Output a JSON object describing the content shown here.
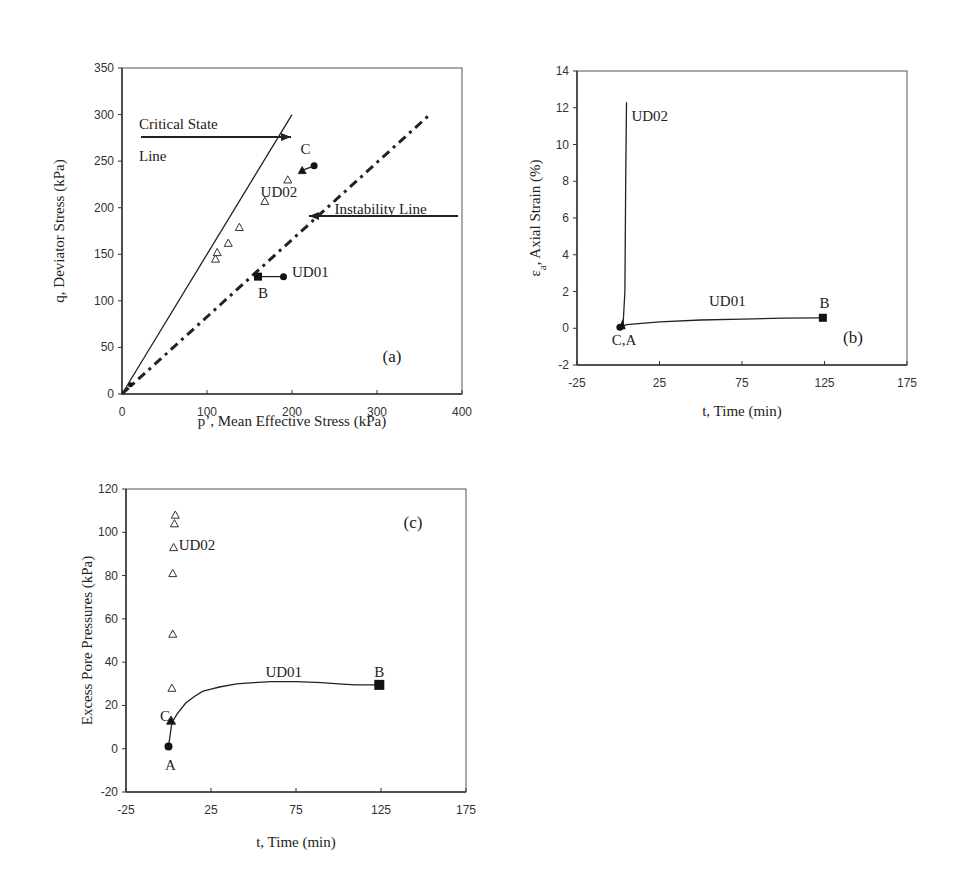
{
  "chart_data": [
    {
      "id": "a",
      "type": "scatter",
      "panel_label": "(a)",
      "title": "",
      "xlabel": "p’, Mean Effective Stress (kPa)",
      "ylabel": "q, Deviator Stress (kPa)",
      "xlim": [
        0,
        400
      ],
      "ylim": [
        0,
        350
      ],
      "xticks": [
        "0",
        "100",
        "200",
        "300",
        "400"
      ],
      "yticks": [
        "0",
        "50",
        "100",
        "150",
        "200",
        "250",
        "300",
        "350"
      ],
      "grid": false,
      "series": [
        {
          "name": "Critical State Line",
          "style": "solid line",
          "x": [
            0,
            200
          ],
          "y": [
            0,
            300
          ]
        },
        {
          "name": "Instability Line",
          "style": "dashed line",
          "x": [
            0,
            362
          ],
          "y": [
            0,
            300
          ]
        },
        {
          "name": "UD01",
          "style": "line with markers",
          "x": [
            190,
            160
          ],
          "y": [
            126,
            126
          ]
        },
        {
          "name": "UD02",
          "style": "open triangles",
          "x": [
            110,
            112,
            125,
            138,
            168,
            195
          ],
          "y": [
            145,
            152,
            162,
            179,
            207,
            230
          ]
        },
        {
          "name": "UD02 start/C",
          "style": "filled markers",
          "x": [
            226,
            212
          ],
          "y": [
            245,
            240
          ]
        }
      ],
      "annotations": [
        {
          "text": "Critical State",
          "x": 20,
          "y": 285
        },
        {
          "text": "Line",
          "x": 20,
          "y": 250
        },
        {
          "text": "Instability Line",
          "x": 250,
          "y": 193
        },
        {
          "text": "C",
          "x": 210,
          "y": 258
        },
        {
          "text": "UD02",
          "x": 163,
          "y": 211
        },
        {
          "text": "UD01",
          "x": 200,
          "y": 126
        },
        {
          "text": "B",
          "x": 160,
          "y": 103
        }
      ]
    },
    {
      "id": "b",
      "type": "line",
      "panel_label": "(b)",
      "title": "",
      "xlabel": "t, Time (min)",
      "ylabel": "εa, Axial Strain (%)",
      "ylabel_main": "ε",
      "ylabel_sub": "a",
      "ylabel_rest": ", Axial Strain (%)",
      "xlim": [
        -25,
        175
      ],
      "ylim": [
        -2,
        14
      ],
      "xticks": [
        "-25",
        "25",
        "75",
        "125",
        "175"
      ],
      "yticks": [
        "-2",
        "0",
        "2",
        "4",
        "6",
        "8",
        "10",
        "12",
        "14"
      ],
      "grid": false,
      "series": [
        {
          "name": "UD02",
          "x": [
            2,
            3,
            4,
            4.5,
            5
          ],
          "y": [
            0.1,
            0.3,
            2,
            8,
            12.3
          ]
        },
        {
          "name": "UD01",
          "x": [
            1,
            5,
            25,
            50,
            75,
            100,
            124
          ],
          "y": [
            0.05,
            0.2,
            0.35,
            0.45,
            0.5,
            0.55,
            0.57
          ]
        }
      ],
      "annotations": [
        {
          "text": "UD02",
          "x": 8,
          "y": 11.3
        },
        {
          "text": "UD01",
          "x": 55,
          "y": 1.2
        },
        {
          "text": "B",
          "x": 122,
          "y": 1.1
        },
        {
          "text": "C,A",
          "x": -4,
          "y": -0.9
        }
      ]
    },
    {
      "id": "c",
      "type": "scatter",
      "panel_label": "(c)",
      "title": "",
      "xlabel": "t, Time (min)",
      "ylabel": "Excess Pore Pressures (kPa)",
      "xlim": [
        -25,
        175
      ],
      "ylim": [
        -20,
        120
      ],
      "xticks": [
        "-25",
        "25",
        "75",
        "125",
        "175"
      ],
      "yticks": [
        "-20",
        "0",
        "20",
        "40",
        "60",
        "80",
        "100",
        "120"
      ],
      "grid": false,
      "series": [
        {
          "name": "UD02",
          "style": "open triangles",
          "x": [
            2,
            2.5,
            2.5,
            3,
            3.5,
            4
          ],
          "y": [
            28,
            53,
            81,
            93,
            104,
            108
          ]
        },
        {
          "name": "UD01",
          "style": "line",
          "x": [
            0,
            2,
            5,
            10,
            15,
            20,
            25,
            30,
            40,
            50,
            60,
            75,
            90,
            100,
            110,
            124
          ],
          "y": [
            1,
            12,
            16,
            21,
            24,
            26.5,
            27.5,
            28.5,
            30,
            30.5,
            31,
            31,
            30.5,
            30,
            29.5,
            29.5
          ]
        }
      ],
      "points": [
        {
          "label": "A",
          "x": 0,
          "y": 1,
          "marker": "circle"
        },
        {
          "label": "C",
          "x": 1.5,
          "y": 13,
          "marker": "triangle"
        },
        {
          "label": "B",
          "x": 124,
          "y": 29.5,
          "marker": "square"
        }
      ],
      "annotations": [
        {
          "text": "UD02",
          "x": 6,
          "y": 92
        },
        {
          "text": "UD01",
          "x": 57,
          "y": 33
        },
        {
          "text": "B",
          "x": 121,
          "y": 33
        },
        {
          "text": "C",
          "x": -5,
          "y": 13
        },
        {
          "text": "A",
          "x": -2,
          "y": -10
        }
      ]
    }
  ]
}
